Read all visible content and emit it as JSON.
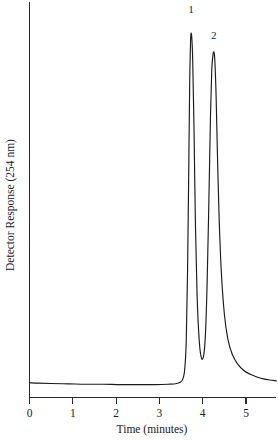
{
  "chart_data": {
    "type": "line",
    "title": "",
    "subtitle": "",
    "xlabel": "Time (minutes)",
    "ylabel": "Detector Response (254 nm)",
    "xlim": [
      0,
      5.7
    ],
    "ylim": [
      0,
      1
    ],
    "grid": false,
    "legend": null,
    "xticks": [
      0,
      1,
      2,
      3,
      4,
      5
    ],
    "xticklabels": [
      "0",
      "1",
      "2",
      "3",
      "4",
      "5"
    ],
    "yticks": [],
    "yticklabels": [],
    "baseline_level": 0.035,
    "annotations": [
      {
        "text": "1",
        "x": 3.73,
        "y": 1.0,
        "name": "peak-label-1"
      },
      {
        "text": "2",
        "x": 4.26,
        "y": 0.93,
        "name": "peak-label-2"
      }
    ],
    "peaks": [
      {
        "label": "1",
        "retention_time": 3.73,
        "height": 0.955,
        "width": 0.09,
        "tail": 0.02
      },
      {
        "label": "2",
        "retention_time": 4.26,
        "height": 0.905,
        "width": 0.075,
        "tail": 0.3
      }
    ],
    "series": [
      {
        "name": "Detector signal",
        "color": "#1a1a1a",
        "x": [
          0.0,
          0.2,
          0.5,
          0.9,
          1.3,
          1.7,
          2.1,
          2.5,
          2.9,
          3.2,
          3.4,
          3.52,
          3.58,
          3.62,
          3.65,
          3.68,
          3.7,
          3.72,
          3.73,
          3.75,
          3.77,
          3.8,
          3.83,
          3.87,
          3.92,
          3.97,
          4.02,
          4.06,
          4.1,
          4.14,
          4.18,
          4.21,
          4.24,
          4.26,
          4.28,
          4.31,
          4.34,
          4.38,
          4.43,
          4.5,
          4.58,
          4.68,
          4.8,
          4.95,
          5.1,
          5.25,
          5.4,
          5.55,
          5.7
        ],
        "y": [
          0.04,
          0.039,
          0.038,
          0.037,
          0.036,
          0.036,
          0.035,
          0.035,
          0.035,
          0.036,
          0.038,
          0.045,
          0.07,
          0.15,
          0.33,
          0.62,
          0.83,
          0.935,
          0.955,
          0.94,
          0.88,
          0.7,
          0.47,
          0.27,
          0.15,
          0.105,
          0.11,
          0.16,
          0.29,
          0.5,
          0.74,
          0.86,
          0.9,
          0.905,
          0.885,
          0.79,
          0.64,
          0.47,
          0.33,
          0.22,
          0.155,
          0.115,
          0.09,
          0.072,
          0.062,
          0.055,
          0.05,
          0.047,
          0.045
        ]
      }
    ]
  },
  "axes": {
    "x_axis_name": "time-axis",
    "y_axis_name": "detector-response-axis"
  }
}
